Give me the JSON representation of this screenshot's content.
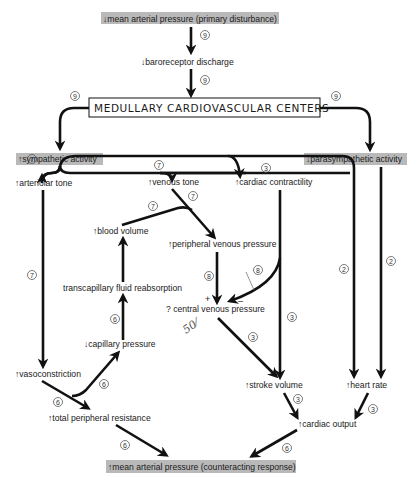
{
  "nodes": {
    "map_primary": "↓mean arterial pressure (primary disturbance)",
    "baroreceptor": "↓baroreceptor discharge",
    "medullary": "MEDULLARY CARDIOVASCULAR CENTERS",
    "sympathetic": "↑sympathetic activity",
    "parasympathetic": "↓parasympathetic activity",
    "arteriolar_tone": "↑arteriolar tone",
    "venous_tone": "↑venous tone",
    "cardiac_contractility": "↑cardiac contractility",
    "blood_volume": "↑blood volume",
    "peripheral_venous_pressure": "↑peripheral venous pressure",
    "transcapillary": "transcapillary fluid reabsorption",
    "central_venous_pressure": "?  central venous pressure",
    "capillary_pressure": "↓capillary pressure",
    "vasoconstriction": "↑vasoconstriction",
    "total_peripheral_resistance": "↑total peripheral resistance",
    "stroke_volume": "↑stroke volume",
    "heart_rate": "↑heart rate",
    "cardiac_output": "↑cardiac output",
    "map_counter": "↑mean arterial pressure (counteracting response)"
  },
  "chapter_refs": {
    "map_to_baro": "9",
    "baro_to_medullary": "9",
    "medullary_to_symp": "9",
    "medullary_to_parasymp": "9",
    "symp_to_arteriolar": "7",
    "symp_to_venous": "7",
    "symp_to_contractility": "3",
    "venous_to_pvp": "7",
    "blood_volume_to_pvp": "7",
    "arteriolar_to_vasoconstriction": "7",
    "pvp_to_cvp": "8",
    "contractility_to_cvp": "8",
    "capillary_to_transcapillary": "6",
    "cvp_to_sv": "3",
    "contractility_to_sv": "3",
    "symp_to_hr": "2",
    "parasymp_to_hr": "2",
    "vasoconstriction_to_tpr": "6",
    "vasoconstriction_to_capillary": "6",
    "sv_to_co": "3",
    "hr_to_co": "3",
    "tpr_to_map": "6",
    "co_to_map": "6"
  },
  "signs": {
    "plus": "+",
    "minus": "–"
  },
  "annotations": {
    "handwritten": "50⁄",
    "handwritten_mark": "/"
  },
  "colors": {
    "highlight": "#b9b9b9",
    "ink": "#111111"
  }
}
